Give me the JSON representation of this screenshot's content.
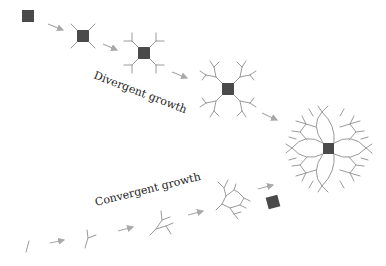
{
  "labels": {
    "divergent": "Divergent growth",
    "convergent": "Convergent growth"
  },
  "colors": {
    "square": "#4a4a4a",
    "branch": "#9a9a9a",
    "arrow": "#a8a8a8",
    "text": "#222222",
    "background": "#ffffff"
  },
  "sequences": {
    "divergent": {
      "label": "Divergent growth",
      "stages": [
        "seed square",
        "square with 4 branches",
        "square with forked branches",
        "square with twice-forked branches",
        "closed flower-like network"
      ]
    },
    "convergent": {
      "label": "Convergent growth",
      "stages": [
        "single segment",
        "Y branch",
        "double fork",
        "partially closed network",
        "square"
      ]
    }
  }
}
